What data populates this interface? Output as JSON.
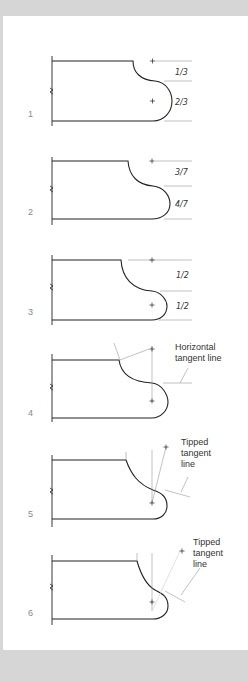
{
  "figure": {
    "background": "#ffffff",
    "frame_color": "#d6d6d6",
    "line_color": "#222222",
    "guide_color": "#999999"
  },
  "steps": [
    {
      "number": "1",
      "labels": [
        "1/3",
        "2/3"
      ]
    },
    {
      "number": "2",
      "labels": [
        "3/7",
        "4/7"
      ]
    },
    {
      "number": "3",
      "labels": [
        "1/2",
        "1/2"
      ]
    },
    {
      "number": "4",
      "labels": [
        "Horizontal",
        "tangent line"
      ]
    },
    {
      "number": "5",
      "labels": [
        "Tipped",
        "tangent",
        "line"
      ]
    },
    {
      "number": "6",
      "labels": [
        "Tipped",
        "tangent",
        "line"
      ]
    }
  ]
}
